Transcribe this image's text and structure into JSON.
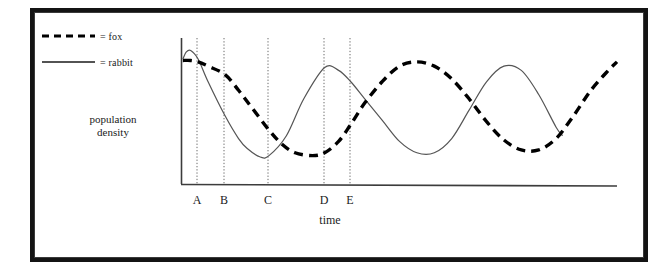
{
  "figure": {
    "legend": {
      "entries": [
        {
          "symbol": "dashed-line",
          "label": "= fox"
        },
        {
          "symbol": "solid-line",
          "label": "= rabbit"
        }
      ]
    },
    "axes": {
      "y_title_line1": "population",
      "y_title_line2": "density",
      "x_title": "time"
    },
    "tick_labels": [
      "A",
      "B",
      "C",
      "D",
      "E"
    ],
    "colors": {
      "ink": "#141414",
      "curve_rabbit": "#555555",
      "curve_fox": "#000000",
      "gridline": "#666666",
      "frame": "#141414"
    }
  },
  "chart_data": {
    "type": "line",
    "title": "",
    "xlabel": "time",
    "ylabel": "population density",
    "grid": true,
    "gridline_type": "vertical dotted reference lines at A, B, C, D, E",
    "legend": [
      "= fox",
      "= rabbit"
    ],
    "legend_position": "top-left outside plot",
    "xlim": [
      0,
      100
    ],
    "ylim": [
      0,
      100
    ],
    "axis_tick_labels": [
      "A",
      "B",
      "C",
      "D",
      "E"
    ],
    "axis_tick_x": [
      3.7,
      9.9,
      20.0,
      32.8,
      38.8
    ],
    "series": [
      {
        "name": "rabbit",
        "style": "solid",
        "x": [
          0.2,
          1.0,
          2.0,
          3.7,
          6.0,
          9.9,
          13.0,
          15.0,
          18.0,
          20.0,
          24.0,
          28.0,
          32.8,
          36.0,
          38.8,
          42.0,
          46.0,
          50.0,
          54.0,
          58.0,
          62.0,
          66.0,
          70.0,
          74.0,
          78.0,
          82.0,
          86.0,
          87.5
        ],
        "y": [
          88,
          93,
          94,
          88,
          72,
          48,
          32,
          25,
          19,
          20,
          34,
          60,
          82,
          80,
          72,
          60,
          45,
          30,
          22,
          22,
          32,
          52,
          72,
          83,
          80,
          63,
          40,
          34
        ]
      },
      {
        "name": "fox",
        "style": "dashed",
        "x": [
          0.2,
          2.0,
          3.7,
          6.0,
          9.9,
          13.0,
          16.0,
          20.0,
          23.0,
          26.0,
          30.0,
          32.8,
          36.0,
          38.8,
          42.0,
          46.0,
          50.0,
          54.0,
          58.0,
          62.0,
          66.0,
          70.0,
          74.0,
          78.0,
          82.0,
          86.0,
          90.0,
          94.0,
          98.0,
          100.0
        ],
        "y": [
          87,
          87,
          86,
          83,
          77,
          66,
          54,
          38,
          28,
          22,
          20,
          22,
          30,
          42,
          57,
          72,
          83,
          86,
          83,
          74,
          60,
          44,
          31,
          24,
          24,
          32,
          48,
          66,
          80,
          86
        ]
      }
    ]
  }
}
